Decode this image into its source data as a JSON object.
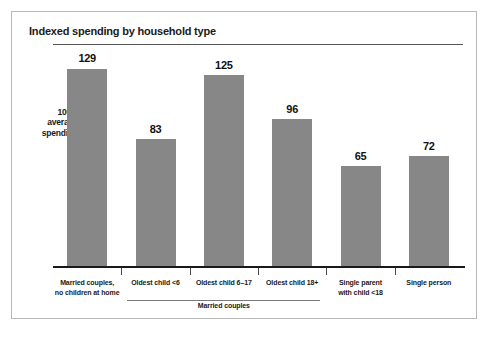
{
  "figure": {
    "title": "Indexed spending by household type",
    "axis_note_lines": [
      "100 =",
      "average",
      "spending"
    ],
    "group_bracket_label": "Married couples",
    "bar_color": "#878787",
    "baseline_color": "#1a1a1a",
    "reference_line_color": "#555555",
    "border_color": "#b9b9b9"
  },
  "chart_data": {
    "type": "bar",
    "title": "Indexed spending by household type",
    "xlabel": "",
    "ylabel": "",
    "ylim": [
      0,
      145
    ],
    "grid": false,
    "legend": "none",
    "reference_line": {
      "value": 100,
      "label": "100 = average spending"
    },
    "group_bracket": {
      "label": "Married couples",
      "covers": [
        "Oldest child <6",
        "Oldest child 6–17",
        "Oldest child 18+"
      ]
    },
    "categories": [
      "Married couples, no children at home",
      "Oldest child <6",
      "Oldest child 6–17",
      "Oldest child 18+",
      "Single parent with child <18",
      "Single person"
    ],
    "category_label_lines": [
      [
        "Married couples,",
        "no children at home"
      ],
      [
        "Oldest child <6"
      ],
      [
        "Oldest child 6–17"
      ],
      [
        "Oldest child 18+"
      ],
      [
        "Single parent",
        "with child <18"
      ],
      [
        "Single person"
      ]
    ],
    "values": [
      129,
      83,
      125,
      96,
      65,
      72
    ],
    "value_labels": [
      "129",
      "83",
      "125",
      "96",
      "65",
      "72"
    ]
  }
}
